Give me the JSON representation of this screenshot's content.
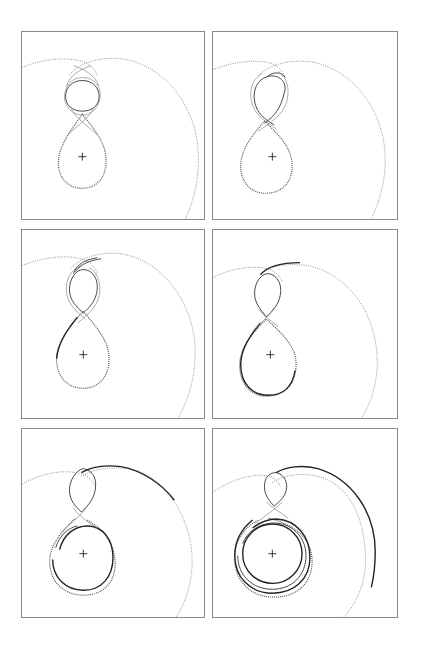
{
  "figure": {
    "panel_count": 6,
    "layout": {
      "rows": 3,
      "cols": 2
    },
    "colors": {
      "border": "#8a8a8a",
      "dotted": "#777777",
      "trajectory": "#222222",
      "background": "#ffffff"
    }
  },
  "panels": [
    {
      "id": 1,
      "row": 1,
      "col": 1,
      "x": 21,
      "y": 31,
      "w": 184,
      "h": 189,
      "stage": "initial figure-eight, upper loop closed"
    },
    {
      "id": 2,
      "row": 1,
      "col": 2,
      "x": 212,
      "y": 31,
      "w": 186,
      "h": 189,
      "stage": "upper loop twisting"
    },
    {
      "id": 3,
      "row": 2,
      "col": 1,
      "x": 21,
      "y": 229,
      "w": 184,
      "h": 190,
      "stage": "trajectory departs upper loop"
    },
    {
      "id": 4,
      "row": 2,
      "col": 2,
      "x": 212,
      "y": 229,
      "w": 186,
      "h": 190,
      "stage": "outer arc begins along big circle"
    },
    {
      "id": 5,
      "row": 3,
      "col": 1,
      "x": 21,
      "y": 428,
      "w": 184,
      "h": 190,
      "stage": "spiral arms forming"
    },
    {
      "id": 6,
      "row": 3,
      "col": 2,
      "x": 212,
      "y": 428,
      "w": 186,
      "h": 190,
      "stage": "multiple rings around central body and long outer arc"
    }
  ],
  "markers": {
    "central_body": "+"
  }
}
